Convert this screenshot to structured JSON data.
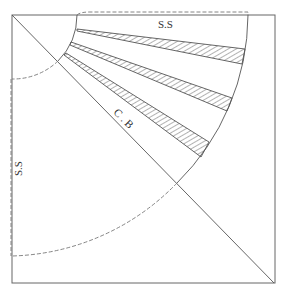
{
  "diagram": {
    "type": "circle-skirt-pleat-pattern",
    "labels": {
      "top_side_seam": "S.S",
      "left_side_seam": "S.S",
      "center_back": "C . B"
    },
    "colors": {
      "line": "#555555",
      "dashed": "#777777",
      "hatch": "#555555",
      "background": "#ffffff"
    },
    "frame": {
      "x": 12,
      "y": 15,
      "width": 263,
      "height": 268
    },
    "center": {
      "x": 12,
      "y": 15
    },
    "waist_radius": 65,
    "hem_radius": 238,
    "pleat_count": 3
  }
}
